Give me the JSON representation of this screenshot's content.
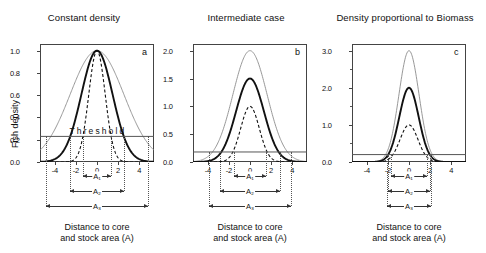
{
  "figure": {
    "y_axis_title": "Fish density",
    "x_axis_caption_line1": "Distance to core",
    "x_axis_caption_line2": "and stock area (A)",
    "threshold_label": "Threshold",
    "span_labels": [
      "A₁",
      "A₂",
      "A₃"
    ]
  },
  "chart_data": [
    {
      "type": "line",
      "panel": "a",
      "title": "Constant density",
      "xlabel": "Distance to core and stock area (A)",
      "ylabel": "Fish density",
      "xlim": [
        -5.4,
        5.4
      ],
      "ylim": [
        0.0,
        1.06
      ],
      "xticks": [
        -4,
        -2,
        0,
        2,
        4
      ],
      "yticks": [
        0.0,
        0.2,
        0.4,
        0.6,
        0.8,
        1.0
      ],
      "ytick_labels": [
        "0.0",
        "0.2",
        "0.4",
        "0.6",
        "0.8",
        "1.0"
      ],
      "xtick_labels": [
        "-4",
        "-2",
        "0",
        "2",
        "4"
      ],
      "grid": false,
      "legend": "none",
      "threshold": 0.23,
      "annotation": "Threshold",
      "series": [
        {
          "name": "wide-gaussian",
          "style": "thin-gray",
          "peak": 1.0,
          "sigma": 2.55,
          "half_width_at_threshold": 4.8
        },
        {
          "name": "medium-gaussian",
          "style": "thick-black",
          "peak": 1.0,
          "sigma": 1.48,
          "half_width_at_threshold": 2.6
        },
        {
          "name": "narrow-gaussian",
          "style": "dashed-black",
          "peak": 1.0,
          "sigma": 0.78,
          "half_width_at_threshold": 1.35
        }
      ],
      "spans": [
        {
          "label": "A₁",
          "from": -1.35,
          "to": 1.35
        },
        {
          "label": "A₂",
          "from": -2.6,
          "to": 2.6
        },
        {
          "label": "A₃",
          "from": -4.8,
          "to": 4.8
        }
      ]
    },
    {
      "type": "line",
      "panel": "b",
      "title": "Intermediate case",
      "xlabel": "Distance to core and stock area (A)",
      "ylabel": "Fish density",
      "xlim": [
        -5.4,
        5.4
      ],
      "ylim": [
        0.0,
        2.12
      ],
      "xticks": [
        -4,
        -2,
        0,
        2,
        4
      ],
      "yticks": [
        0.0,
        0.5,
        1.0,
        1.5,
        2.0
      ],
      "ytick_labels": [
        "0.0",
        "0.5",
        "1.0",
        "1.5",
        "2.0"
      ],
      "xtick_labels": [
        "-4",
        "-2",
        "0",
        "2",
        "4"
      ],
      "grid": false,
      "legend": "none",
      "threshold": 0.18,
      "series": [
        {
          "name": "wide-gaussian",
          "style": "thin-gray",
          "peak": 2.0,
          "sigma": 1.62,
          "half_width_at_threshold": 3.9
        },
        {
          "name": "medium-gaussian",
          "style": "thick-black",
          "peak": 1.5,
          "sigma": 1.32,
          "half_width_at_threshold": 2.8
        },
        {
          "name": "narrow-gaussian",
          "style": "dashed-black",
          "peak": 1.0,
          "sigma": 0.88,
          "half_width_at_threshold": 1.5
        }
      ],
      "spans": [
        {
          "label": "A₁",
          "from": -1.5,
          "to": 1.5
        },
        {
          "label": "A₂",
          "from": -2.8,
          "to": 2.8
        },
        {
          "label": "A₃",
          "from": -3.9,
          "to": 3.9
        }
      ]
    },
    {
      "type": "line",
      "panel": "c",
      "title": "Density proportional to Biomass",
      "xlabel": "Distance to core and stock area (A)",
      "ylabel": "Fish density",
      "xlim": [
        -5.4,
        5.4
      ],
      "ylim": [
        0.0,
        3.18
      ],
      "xticks": [
        -4,
        -2,
        0,
        2,
        4
      ],
      "yticks": [
        0.0,
        1.0,
        2.0,
        3.0
      ],
      "ytick_labels": [
        "0.0",
        "1.0",
        "2.0",
        "3.0"
      ],
      "xtick_labels": [
        "-4",
        "-2",
        "0",
        "2",
        "4"
      ],
      "grid": false,
      "legend": "none",
      "threshold": 0.2,
      "series": [
        {
          "name": "wide-gaussian",
          "style": "thin-gray",
          "peak": 3.0,
          "sigma": 0.95,
          "half_width_at_threshold": 2.1
        },
        {
          "name": "medium-gaussian",
          "style": "thick-black",
          "peak": 2.0,
          "sigma": 0.92,
          "half_width_at_threshold": 1.95
        },
        {
          "name": "narrow-gaussian",
          "style": "dashed-black",
          "peak": 1.0,
          "sigma": 0.85,
          "half_width_at_threshold": 1.7
        }
      ],
      "spans": [
        {
          "label": "A₁",
          "from": -1.7,
          "to": 1.7
        },
        {
          "label": "A₂",
          "from": -1.95,
          "to": 1.95
        },
        {
          "label": "A₃",
          "from": -2.1,
          "to": 2.1
        }
      ]
    }
  ],
  "colors": {
    "thin_gray": "#8c8c8c",
    "thick_black": "#111111",
    "dashed_black": "#111111",
    "threshold_line": "#555555",
    "axis": "#444444",
    "guide": "#666666"
  }
}
